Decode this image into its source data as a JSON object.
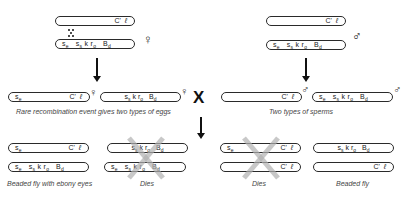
{
  "genes": {
    "se": "s",
    "se_sub": "e",
    "ss": "s",
    "ss_sub": "s",
    "k": "k",
    "ro": "r",
    "ro_sub": "o",
    "bd": "B",
    "bd_sub": "d",
    "c": "C'",
    "l": "ℓ"
  },
  "symbols": {
    "female": "♀",
    "male": "♂",
    "cross": "X"
  },
  "parents": {
    "female_label": "♀",
    "male_label": "♂"
  },
  "captions": {
    "eggs": "Rare recombination event gives two types of eggs",
    "sperms": "Two types of sperms",
    "offspring1": "Beaded fly with ebony eyes",
    "offspring2": "Dies",
    "offspring3": "Dies",
    "offspring4": "Beaded fly"
  },
  "colors": {
    "outline": "#2a2a2a",
    "xmark": "#b0b0b0",
    "text": "#222222"
  }
}
